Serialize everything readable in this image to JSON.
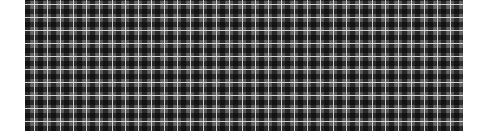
{
  "image": {
    "description": "Grayscale tartan / plaid fabric pattern",
    "colors": {
      "background": "#ffffff",
      "base": "#5a5a5a",
      "dark_band": "#1a1a1a",
      "light_line": "#ebebeb"
    },
    "pattern_period_px": 13
  }
}
